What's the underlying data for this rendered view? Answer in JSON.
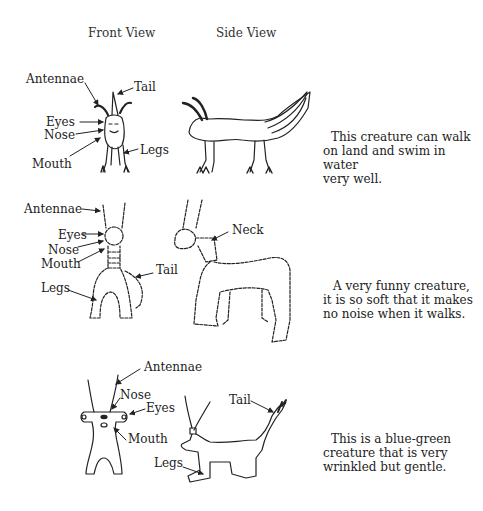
{
  "headers": {
    "front": "Front View",
    "side": "Side View"
  },
  "creatures": [
    {
      "front_labels": {
        "antennae": "Antennae",
        "tail": "Tail",
        "eyes": "Eyes",
        "nose": "Nose",
        "mouth": "Mouth",
        "legs": "Legs"
      },
      "description": [
        "This creature can walk",
        "on land and swim in water",
        "very well."
      ]
    },
    {
      "front_labels": {
        "antennae": "Antennae",
        "eyes": "Eyes",
        "nose": "Nose",
        "mouth": "Mouth",
        "tail": "Tail",
        "legs": "Legs"
      },
      "side_labels": {
        "neck": "Neck"
      },
      "description": [
        "A very funny creature,",
        "it is so soft that it makes",
        "no noise when it walks."
      ]
    },
    {
      "front_labels": {
        "antennae": "Antennae",
        "nose": "Nose",
        "eyes": "Eyes",
        "mouth": "Mouth"
      },
      "side_labels": {
        "tail": "Tail",
        "legs": "Legs"
      },
      "description": [
        "This is a blue-green",
        "creature that is very",
        "wrinkled but gentle."
      ]
    }
  ]
}
